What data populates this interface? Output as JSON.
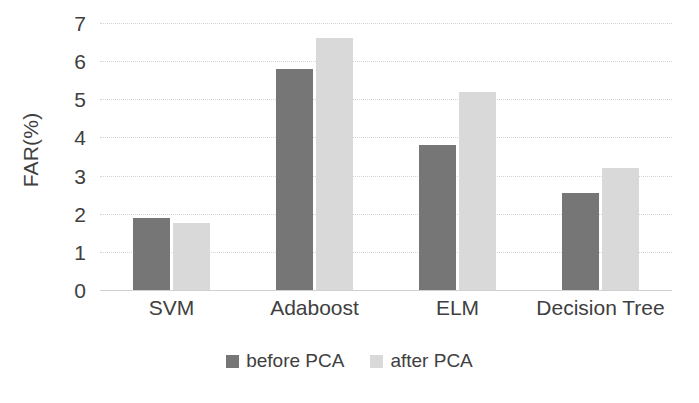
{
  "chart_data": {
    "type": "bar",
    "title": "",
    "xlabel": "",
    "ylabel": "FAR(%)",
    "categories": [
      "SVM",
      "Adaboost",
      "ELM",
      "Decision Tree"
    ],
    "series": [
      {
        "name": "before PCA",
        "color": "#767676",
        "values": [
          1.9,
          5.8,
          3.8,
          2.55
        ]
      },
      {
        "name": "after PCA",
        "color": "#d9d9d9",
        "values": [
          1.75,
          6.6,
          5.2,
          3.2
        ]
      }
    ],
    "ylim": [
      0,
      7
    ],
    "yticks": [
      0,
      1,
      2,
      3,
      4,
      5,
      6,
      7
    ],
    "ytick_labels": [
      "0",
      "1",
      "2",
      "3",
      "4",
      "5",
      "6",
      "7"
    ],
    "grid": "horizontal-dotted",
    "legend_position": "bottom-center"
  },
  "axes": {
    "y_title": "FAR(%)"
  },
  "legend": {
    "items": [
      {
        "label": "before PCA",
        "color": "#767676"
      },
      {
        "label": "after PCA",
        "color": "#d9d9d9"
      }
    ]
  }
}
